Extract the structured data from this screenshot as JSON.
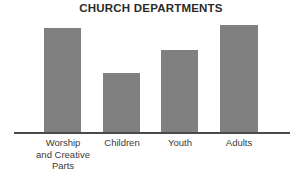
{
  "chart_data": {
    "type": "bar",
    "title": "CHURCH DEPARTMENTS",
    "xlabel": "",
    "ylabel": "",
    "categories": [
      "Worship and Creative Parts",
      "Children",
      "Youth",
      "Adults"
    ],
    "category_labels_wrapped": [
      "Worship\nand Creative\nParts",
      "Children",
      "Youth",
      "Adults"
    ],
    "values": [
      105,
      60,
      83,
      108
    ],
    "ylim": [
      0,
      115
    ],
    "grid": false,
    "legend": null,
    "axis": {
      "x_axis_visible": true,
      "y_axis_visible": false,
      "tick_marks": false
    },
    "colors": {
      "bar_fill": "#808080",
      "axis_line": "#4a4a4a",
      "title_text": "#2b2b2b",
      "label_text": "#3a3a3a",
      "background": "#ffffff"
    },
    "bar_geometry": [
      {
        "left": 44,
        "top": 28,
        "width": 37,
        "height": 104
      },
      {
        "left": 103,
        "top": 73,
        "width": 37,
        "height": 59
      },
      {
        "left": 161,
        "top": 50,
        "width": 37,
        "height": 82
      },
      {
        "left": 220,
        "top": 25,
        "width": 38,
        "height": 107
      }
    ],
    "label_geometry": [
      {
        "left": 24,
        "width": 78
      },
      {
        "left": 97,
        "width": 50
      },
      {
        "left": 155,
        "width": 50
      },
      {
        "left": 214,
        "width": 50
      }
    ]
  }
}
